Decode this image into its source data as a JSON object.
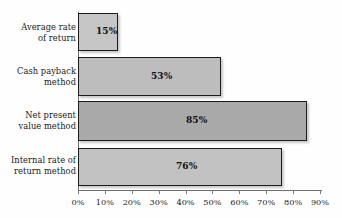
{
  "chart_data": {
    "type": "bar",
    "orientation": "horizontal",
    "title": "",
    "subtitle": "",
    "xlabel": "",
    "ylabel": "",
    "xlim": [
      0,
      90
    ],
    "grid": false,
    "legend": "none",
    "categories": [
      "Average rate of return",
      "Cash payback method",
      "Net present value method",
      "Internal rate of return method"
    ],
    "category_lines": [
      [
        "Average rate",
        "of return"
      ],
      [
        "Cash payback",
        "method"
      ],
      [
        "Net present",
        "value method"
      ],
      [
        "Internal rate of",
        "return method"
      ]
    ],
    "values": [
      15,
      53,
      85,
      76
    ],
    "value_labels": [
      "15%",
      "53%",
      "85%",
      "76%"
    ],
    "tick_labels": [
      "0%",
      "10%",
      "20%",
      "30%",
      "40%",
      "50%",
      "60%",
      "70%",
      "80%",
      "90%"
    ],
    "tick_values": [
      0,
      10,
      20,
      30,
      40,
      50,
      60,
      70,
      80,
      90
    ],
    "bar_colors": [
      "#c6c6c6",
      "#bdbdbd",
      "#a9a9a9",
      "#c2c2c2"
    ],
    "bar_border_color": "#1c1c1c",
    "axis_color": "#6f6f6f",
    "text_color": "#1a1a1a",
    "background_color": "#fefefe"
  }
}
